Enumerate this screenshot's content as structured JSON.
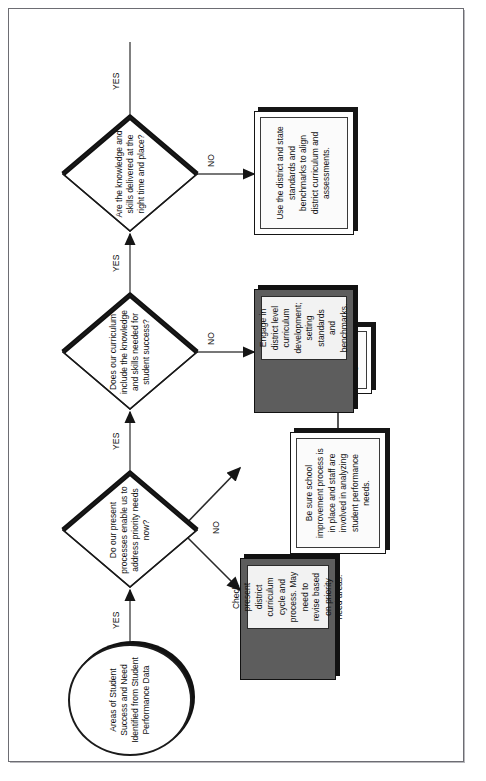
{
  "diagram": {
    "orientation": "rotated-90-counterclockwise",
    "colors": {
      "line": "#1b1b1b",
      "box_fill": "#ffffff",
      "dark_box_fill": "#5d5d5d",
      "shadow": "#151515",
      "frame": "#6d6d73"
    },
    "start": {
      "shape": "oval",
      "text": "Areas of Student Success and Need Identified from Student Performance Data"
    },
    "decisions": [
      {
        "id": "d1",
        "shape": "diamond",
        "text": "Do our present processes enable us to address priority needs now?",
        "yes_label": "YES",
        "no_label": "NO"
      },
      {
        "id": "d2",
        "shape": "diamond",
        "text": "Does our curriculum include the knowledge and skills needed for student success?",
        "yes_label": "YES",
        "no_label": "NO"
      },
      {
        "id": "d3",
        "shape": "diamond",
        "text": "Are the knowledge and skills delivered at the right time and place?",
        "yes_label": "YES",
        "no_label": "NO"
      }
    ],
    "processes": [
      {
        "id": "p1",
        "style": "dark",
        "text": "Check present district curriculum cycle and process.  May need to revise based on priority need areas."
      },
      {
        "id": "p2",
        "style": "light",
        "text": "Be sure school improvement process is in place and staff are involved in analyzing student performance needs."
      },
      {
        "id": "p3",
        "style": "light-small",
        "text": "Identify school improvement goals."
      },
      {
        "id": "p4",
        "style": "dark",
        "text": "Engage in district level curriculum development; setting standards and benchmarks."
      },
      {
        "id": "p5",
        "style": "light",
        "text": "Use the district and state standards and benchmarks to align district curriculum and assessments."
      }
    ],
    "edge_labels": {
      "yes1": "YES",
      "no1": "NO",
      "yes2": "YES",
      "no2": "NO",
      "yes3": "YES",
      "no3": "NO",
      "yes_final": "YES"
    }
  }
}
